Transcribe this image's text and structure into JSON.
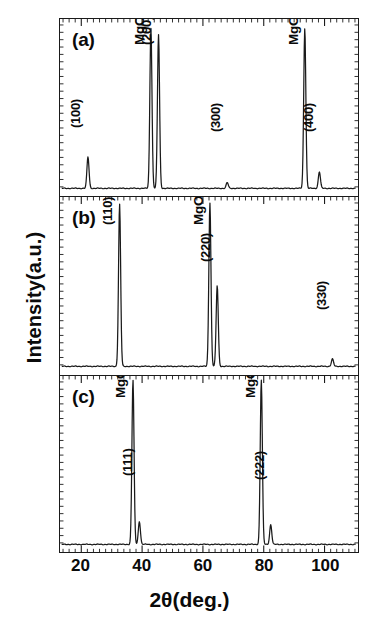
{
  "axes": {
    "ylabel": "Intensity(a.u.)",
    "xlabel_prefix": "2",
    "xlabel_theta": "θ",
    "xlabel_suffix": "(deg.)",
    "xlabel_full": "2θ(deg.)",
    "xticks": [
      20,
      40,
      60,
      80,
      100
    ],
    "xticklabels": [
      "20",
      "40",
      "60",
      "80",
      "100"
    ],
    "xlim": [
      13,
      111
    ],
    "minor_tick_step": 2,
    "grid": false,
    "legend": "none"
  },
  "panels": [
    {
      "tag": "(a)",
      "peaks": [
        {
          "label": "(100)",
          "two_theta": 22.2,
          "height": 0.19,
          "label_y": 0.47
        },
        {
          "label": "MgO(200)",
          "two_theta": 42.9,
          "height": 0.97,
          "label_y": 0.94
        },
        {
          "label": "(200)",
          "two_theta": 45.4,
          "height": 0.93,
          "label_y": 0.94
        },
        {
          "label": "(300)",
          "two_theta": 68.0,
          "height": 0.035,
          "label_y": 0.45
        },
        {
          "label": "MgO(400)",
          "two_theta": 93.5,
          "height": 0.97,
          "label_y": 0.94
        },
        {
          "label": "(400)",
          "two_theta": 98.3,
          "height": 0.1,
          "label_y": 0.45
        }
      ]
    },
    {
      "tag": "(b)",
      "peaks": [
        {
          "label": "(110)",
          "two_theta": 32.6,
          "height": 0.98,
          "label_y": 0.93
        },
        {
          "label": "MgO(220)",
          "two_theta": 62.3,
          "height": 0.99,
          "label_y": 0.93
        },
        {
          "label": "(220)",
          "two_theta": 64.7,
          "height": 0.49,
          "label_y": 0.72
        },
        {
          "label": "(330)",
          "two_theta": 102.6,
          "height": 0.045,
          "label_y": 0.45
        }
      ]
    },
    {
      "tag": "(c)",
      "peaks": [
        {
          "label": "MgO(111)",
          "two_theta": 37.0,
          "height": 1.0,
          "label_y": 0.96
        },
        {
          "label": "(111)",
          "two_theta": 39.1,
          "height": 0.14,
          "label_y": 0.52
        },
        {
          "label": "MgO(222)",
          "two_theta": 79.2,
          "height": 1.0,
          "label_y": 0.96
        },
        {
          "label": "(222)",
          "two_theta": 82.3,
          "height": 0.12,
          "label_y": 0.5
        }
      ]
    }
  ],
  "chart_data": {
    "type": "line",
    "title": "",
    "xlabel": "2θ(deg.)",
    "ylabel": "Intensity(a.u.)",
    "xlim": [
      13,
      111
    ],
    "ylim": [
      0,
      1
    ],
    "grid": false,
    "legend_position": "none",
    "series": [
      {
        "name": "(a)",
        "x": [
          22.2,
          42.9,
          45.4,
          68.0,
          93.5,
          98.3
        ],
        "values": [
          0.19,
          0.97,
          0.93,
          0.035,
          0.97,
          0.1
        ],
        "peak_labels": [
          "(100)",
          "MgO(200)",
          "(200)",
          "(300)",
          "MgO(400)",
          "(400)"
        ]
      },
      {
        "name": "(b)",
        "x": [
          32.6,
          62.3,
          64.7,
          102.6
        ],
        "values": [
          0.98,
          0.99,
          0.49,
          0.045
        ],
        "peak_labels": [
          "(110)",
          "MgO(220)",
          "(220)",
          "(330)"
        ]
      },
      {
        "name": "(c)",
        "x": [
          37.0,
          39.1,
          79.2,
          82.3
        ],
        "values": [
          1.0,
          0.14,
          1.0,
          0.12
        ],
        "peak_labels": [
          "MgO(111)",
          "(111)",
          "MgO(222)",
          "(222)"
        ]
      }
    ]
  },
  "colors": {
    "line": "#1a1a1a",
    "frame": "#1a1a1a",
    "text": "#0a0a0a",
    "background": "#ffffff"
  }
}
